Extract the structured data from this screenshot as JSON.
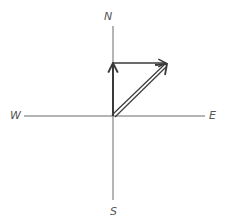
{
  "diagram": {
    "type": "vector-addition-compass",
    "labels": {
      "north": "N",
      "south": "S",
      "west": "W",
      "east": "E"
    },
    "origin": [
      113,
      116
    ],
    "axes": {
      "vertical": {
        "from": [
          113,
          26
        ],
        "to": [
          113,
          200
        ]
      },
      "horizontal": {
        "from": [
          24,
          116
        ],
        "to": [
          205,
          116
        ]
      }
    },
    "vectors": [
      {
        "name": "north-component",
        "from": [
          113,
          116
        ],
        "to": [
          113,
          63
        ]
      },
      {
        "name": "east-component",
        "from": [
          113,
          63
        ],
        "to": [
          167,
          63
        ]
      },
      {
        "name": "resultant",
        "from": [
          113,
          116
        ],
        "to": [
          166,
          65
        ]
      }
    ],
    "colors": {
      "axis": "#6a6a6a",
      "vector": "#3a3a3a",
      "label": "#555555",
      "background": "#ffffff"
    }
  }
}
